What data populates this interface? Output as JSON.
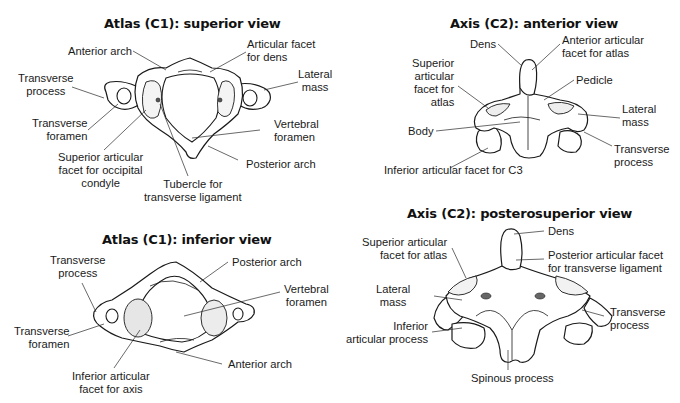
{
  "panels": {
    "atlas_superior": {
      "title": "Atlas (C1): superior view",
      "labels": {
        "anterior_arch": "Anterior arch",
        "articular_facet_dens_1": "Articular facet",
        "articular_facet_dens_2": "for dens",
        "transverse_process_1": "Transverse",
        "transverse_process_2": "process",
        "lateral_mass_1": "Lateral",
        "lateral_mass_2": "mass",
        "transverse_foramen_1": "Transverse",
        "transverse_foramen_2": "foramen",
        "vertebral_foramen_1": "Vertebral",
        "vertebral_foramen_2": "foramen",
        "superior_articular_facet_1": "Superior articular",
        "superior_articular_facet_2": "facet for occipital",
        "superior_articular_facet_3": "condyle",
        "posterior_arch": "Posterior arch",
        "tubercle_1": "Tubercle for",
        "tubercle_2": "transverse ligament"
      }
    },
    "axis_anterior": {
      "title": "Axis (C2): anterior view",
      "labels": {
        "dens": "Dens",
        "anterior_facet_1": "Anterior articular",
        "anterior_facet_2": "facet for atlas",
        "superior_facet_1": "Superior",
        "superior_facet_2": "articular",
        "superior_facet_3": "facet for",
        "superior_facet_4": "atlas",
        "pedicle": "Pedicle",
        "lateral_mass_1": "Lateral",
        "lateral_mass_2": "mass",
        "body": "Body",
        "transverse_process_1": "Transverse",
        "transverse_process_2": "process",
        "inferior_facet": "Inferior articular facet for C3"
      }
    },
    "atlas_inferior": {
      "title": "Atlas (C1): inferior view",
      "labels": {
        "transverse_process_1": "Transverse",
        "transverse_process_2": "process",
        "posterior_arch": "Posterior arch",
        "vertebral_foramen_1": "Vertebral",
        "vertebral_foramen_2": "foramen",
        "transverse_foramen_1": "Transverse",
        "transverse_foramen_2": "foramen",
        "anterior_arch": "Anterior arch",
        "inferior_facet_1": "Inferior articular",
        "inferior_facet_2": "facet for axis"
      }
    },
    "axis_posterosuperior": {
      "title": "Axis (C2): posterosuperior view",
      "labels": {
        "dens": "Dens",
        "superior_facet_1": "Superior articular",
        "superior_facet_2": "facet for atlas",
        "posterior_facet_1": "Posterior articular facet",
        "posterior_facet_2": "for transverse ligament",
        "lateral_mass_1": "Lateral",
        "lateral_mass_2": "mass",
        "transverse_process_1": "Transverse",
        "transverse_process_2": "process",
        "inferior_process_1": "Inferior",
        "inferior_process_2": "articular process",
        "spinous_process": "Spinous process"
      }
    }
  }
}
